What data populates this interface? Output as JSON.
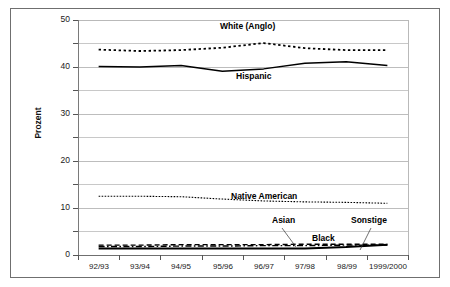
{
  "chart_data": {
    "type": "line",
    "title": "",
    "xlabel": "",
    "ylabel": "Prozent",
    "ylim": [
      0,
      50
    ],
    "yticks": [
      0,
      10,
      20,
      30,
      40,
      50
    ],
    "gridlines": [
      0,
      5,
      10,
      15,
      20,
      25,
      30,
      35,
      40,
      45,
      50
    ],
    "grid": true,
    "legend_position": "inline-annotations",
    "categories": [
      "92/93",
      "93/94",
      "94/95",
      "95/96",
      "96/97",
      "97/98",
      "98/99",
      "1999/2000"
    ],
    "series": [
      {
        "name": "White (Anglo)",
        "style": "dotted",
        "values": [
          43.7,
          43.4,
          43.6,
          44.1,
          45.1,
          44.0,
          43.6,
          43.6
        ]
      },
      {
        "name": "Hispanic",
        "style": "solid",
        "values": [
          40.1,
          40.0,
          40.3,
          39.1,
          39.6,
          40.8,
          41.1,
          40.3
        ]
      },
      {
        "name": "Native American",
        "style": "fine-dotted",
        "values": [
          12.5,
          12.5,
          12.4,
          11.9,
          11.5,
          11.3,
          11.2,
          11.0
        ]
      },
      {
        "name": "Asian",
        "style": "dash-dot",
        "values": [
          1.8,
          1.8,
          1.9,
          1.9,
          2.0,
          2.0,
          2.1,
          2.1
        ]
      },
      {
        "name": "Black",
        "style": "dashed",
        "values": [
          2.1,
          2.1,
          2.2,
          2.2,
          2.2,
          2.3,
          2.3,
          2.3
        ]
      },
      {
        "name": "Sonstige",
        "style": "solid-thick",
        "values": [
          1.4,
          1.4,
          1.4,
          1.4,
          1.4,
          1.4,
          1.7,
          2.2
        ]
      }
    ],
    "annotations": [
      {
        "text": "White (Anglo)",
        "x": 220,
        "y": 26
      },
      {
        "text": "Hispanic",
        "x": 236,
        "y": 71
      },
      {
        "text": "Native American",
        "x": 231,
        "y": 196
      },
      {
        "text": "Asian",
        "x": 272,
        "y": 219
      },
      {
        "text": "Sonstige",
        "x": 351,
        "y": 219
      },
      {
        "text": "Black",
        "x": 312,
        "y": 237
      }
    ]
  },
  "axis": {
    "y_label": "Prozent",
    "y_tick_labels": [
      "50",
      "40",
      "30",
      "20",
      "10",
      "0"
    ],
    "x_tick_labels": [
      "92/93",
      "93/94",
      "94/95",
      "95/96",
      "96/97",
      "97/98",
      "98/99",
      "1999/2000"
    ]
  },
  "labels": {
    "white_anglo": "White (Anglo)",
    "hispanic": "Hispanic",
    "native_american": "Native American",
    "asian": "Asian",
    "sonstige": "Sonstige",
    "black": "Black"
  },
  "colors": {
    "line": "#000000",
    "grid": "#c8c8c8",
    "frame": "#6f6f6f",
    "text": "#111111",
    "background": "#ffffff"
  }
}
